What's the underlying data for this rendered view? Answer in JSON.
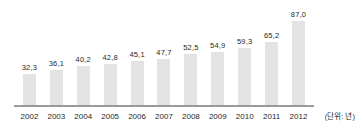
{
  "chart_data": {
    "type": "bar",
    "categories": [
      "2002",
      "2003",
      "2004",
      "2005",
      "2006",
      "2007",
      "2008",
      "2009",
      "2010",
      "2011",
      "2012"
    ],
    "values": [
      32.3,
      36.1,
      40.2,
      42.8,
      45.1,
      47.7,
      52.5,
      54.9,
      59.3,
      65.2,
      87.0
    ],
    "value_labels": [
      "32,3",
      "36,1",
      "40,2",
      "42,8",
      "45,1",
      "47,7",
      "52,5",
      "54,9",
      "59,3",
      "65,2",
      "87,0"
    ],
    "title": "",
    "xlabel": "",
    "ylabel": "",
    "unit_label": "(단위: 년)",
    "ylim": [
      0,
      90
    ],
    "grid": false,
    "legend_position": "none",
    "colors": {
      "bar": "#e3e3e3",
      "axis_line": "#9a9a9a",
      "text": "#1f1f1f",
      "background": "#ffffff"
    }
  }
}
